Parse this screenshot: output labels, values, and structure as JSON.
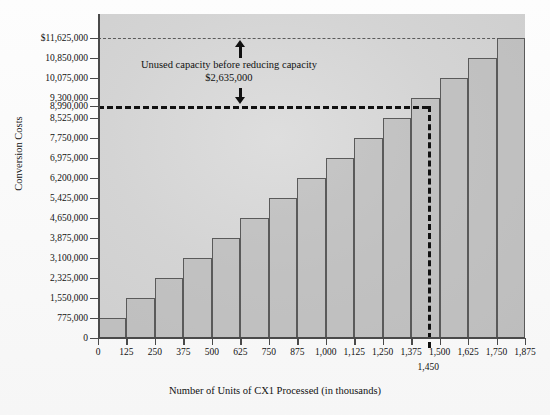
{
  "chart_data": {
    "type": "bar",
    "title": "",
    "xlabel": "Number of Units of CX1 Processed (in thousands)",
    "ylabel": "Conversion Costs",
    "xlim": [
      0,
      1875
    ],
    "ylim": [
      0,
      11625000
    ],
    "grid": false,
    "legend": "none",
    "step_width": 125,
    "step_height": 775000,
    "categories": [
      "0-125",
      "125-250",
      "250-375",
      "375-500",
      "500-625",
      "625-750",
      "750-875",
      "875-1,000",
      "1,000-1,125",
      "1,125-1,250",
      "1,250-1,375",
      "1,375-1,500",
      "1,500-1,625",
      "1,625-1,750",
      "1,750-1,875"
    ],
    "values": [
      775000,
      1550000,
      2325000,
      3100000,
      3875000,
      4650000,
      5425000,
      6200000,
      6975000,
      7750000,
      8525000,
      9300000,
      10075000,
      10850000,
      11625000
    ],
    "x_start": [
      0,
      125,
      250,
      375,
      500,
      625,
      750,
      875,
      1000,
      1125,
      1250,
      1375,
      1500,
      1625,
      1750
    ],
    "x_end": [
      125,
      250,
      375,
      500,
      625,
      750,
      875,
      1000,
      1125,
      1250,
      1375,
      1500,
      1625,
      1750,
      1875
    ],
    "xticks": [
      0,
      125,
      250,
      375,
      500,
      625,
      750,
      875,
      1000,
      1125,
      1250,
      1375,
      1500,
      1625,
      1750,
      1875
    ],
    "xtick_labels": [
      "0",
      "125",
      "250",
      "375",
      "500",
      "625",
      "750",
      "875",
      "1,000",
      "1,125",
      "1,250",
      "1,375",
      "1,500",
      "1,625",
      "1,750",
      "1,875"
    ],
    "yticks": [
      0,
      775000,
      1550000,
      2325000,
      3100000,
      3875000,
      4650000,
      5425000,
      6200000,
      6975000,
      7750000,
      8525000,
      8990000,
      9300000,
      10075000,
      10850000,
      11625000
    ],
    "ytick_labels": [
      "0",
      "775,000",
      "1,550,000",
      "2,325,000",
      "3,100,000",
      "3,875,000",
      "4,650,000",
      "5,425,000",
      "6,200,000",
      "6,975,000",
      "7,750,000",
      "8,525,000",
      "8,990,000",
      "9,300,000",
      "10,075,000",
      "10,850,000",
      "$11,625,000"
    ],
    "annotations": [
      {
        "name": "unused-capacity",
        "line1": "Unused capacity before reducing capacity",
        "line2": "$2,635,000",
        "from": 8990000,
        "to": 11625000,
        "at_x": 625
      }
    ],
    "reference_lines": [
      {
        "name": "capacity-line",
        "orientation": "horizontal",
        "value": 11625000,
        "style": "dashed",
        "weight": "thin"
      },
      {
        "name": "used-capacity-line",
        "orientation": "horizontal",
        "value": 8990000,
        "style": "dashed",
        "weight": "bold"
      },
      {
        "name": "volume-line",
        "orientation": "vertical",
        "value": 1450,
        "style": "dashed",
        "weight": "bold"
      }
    ],
    "extra_x_label": {
      "value": 1450,
      "text": "1,450"
    }
  },
  "axes": {
    "y_title": "Conversion Costs",
    "x_title": "Number of Units of CX1 Processed (in thousands)"
  },
  "annotation": {
    "line1": "Unused capacity before reducing capacity",
    "line2": "$2,635,000"
  },
  "colors": {
    "step_fill": "#aaaaaa",
    "step_border": "#5a5a5a",
    "plot_bg": "#d4d4d4",
    "axis": "#4a4a4a",
    "bold_dash": "#111111",
    "text": "#111111"
  }
}
